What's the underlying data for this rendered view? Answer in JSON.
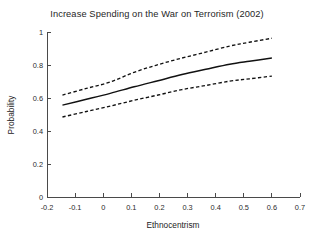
{
  "chart_data": {
    "type": "line",
    "title": "Increase Spending on the War on Terrorism (2002)",
    "xlabel": "Ethnocentrism",
    "ylabel": "Probability",
    "xlim": [
      -0.2,
      0.7
    ],
    "ylim": [
      0,
      1
    ],
    "xticks": [
      -0.2,
      -0.1,
      0,
      0.1,
      0.2,
      0.3,
      0.4,
      0.5,
      0.6,
      0.7
    ],
    "xtick_labels": [
      "-0.2",
      "-0.1",
      "0",
      "0.1",
      "0.2",
      "0.3",
      "0.4",
      "0.5",
      "0.6",
      "0.7"
    ],
    "yticks": [
      0,
      0.2,
      0.4,
      0.6,
      0.8,
      1
    ],
    "ytick_labels": [
      "0",
      "0.2",
      "0.4",
      "0.6",
      "0.8",
      "1"
    ],
    "grid": false,
    "legend": "none",
    "x": [
      -0.145,
      -0.06,
      0.025,
      0.11,
      0.195,
      0.28,
      0.365,
      0.45,
      0.52,
      0.6
    ],
    "series": [
      {
        "name": "Upper 95% confidence bound",
        "style": "dashed",
        "values": [
          0.618,
          0.658,
          0.697,
          0.756,
          0.802,
          0.842,
          0.878,
          0.915,
          0.938,
          0.962
        ]
      },
      {
        "name": "Predicted probability",
        "style": "solid",
        "values": [
          0.557,
          0.592,
          0.628,
          0.668,
          0.705,
          0.742,
          0.774,
          0.805,
          0.823,
          0.842
        ]
      },
      {
        "name": "Lower 95% confidence bound",
        "style": "dashed",
        "values": [
          0.485,
          0.518,
          0.551,
          0.586,
          0.618,
          0.651,
          0.676,
          0.702,
          0.716,
          0.733
        ]
      }
    ]
  }
}
